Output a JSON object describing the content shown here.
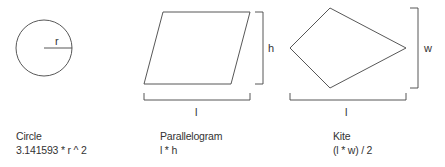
{
  "shapes": [
    {
      "id": "circle",
      "name": "Circle",
      "formula": "3.141593 * r ^ 2",
      "labels": {
        "radius": "r"
      }
    },
    {
      "id": "parallelogram",
      "name": "Parallelogram",
      "formula": "l * h",
      "labels": {
        "height": "h",
        "length": "l"
      }
    },
    {
      "id": "kite",
      "name": "Kite",
      "formula": "(l * w) / 2",
      "labels": {
        "width": "w",
        "length": "l"
      }
    }
  ],
  "colors": {
    "stroke": "#444444",
    "text": "#333333",
    "background": "#ffffff"
  }
}
